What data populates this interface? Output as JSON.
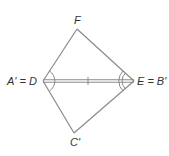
{
  "diagram": {
    "type": "geometry-figure",
    "colors": {
      "stroke": "#8a8a8a",
      "shared_side": "#8a8a8a",
      "label": "#333333",
      "background": "#ffffff"
    },
    "vertices": {
      "F": {
        "label": "F",
        "x": 77,
        "y": 29
      },
      "D": {
        "label": "A' = D",
        "x": 43,
        "y": 81
      },
      "E": {
        "label": "E = B'",
        "x": 134,
        "y": 81
      },
      "C": {
        "label": "C'",
        "x": 74,
        "y": 133
      }
    },
    "labels": {
      "top": "F",
      "left": "A' = D",
      "right": "E = B'",
      "bottom": "C'"
    },
    "markings": {
      "shared_side_tick": "single tick mark",
      "angle_D": "single arc (spanning both triangles)",
      "angle_E": "double arc (spanning both triangles)"
    }
  }
}
